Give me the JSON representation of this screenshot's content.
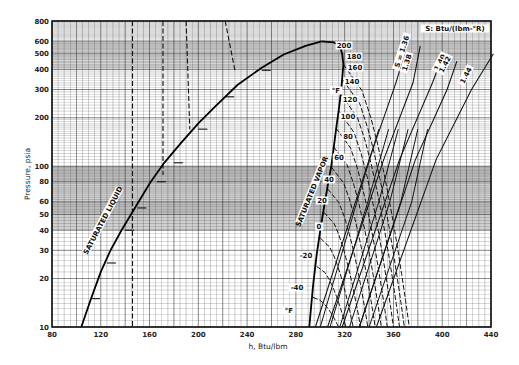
{
  "chart_data": {
    "type": "line",
    "title": "",
    "xlabel": "h, Btu/lbm",
    "ylabel": "Pressure, psia",
    "xlim": [
      80,
      440
    ],
    "ylim": [
      10,
      800
    ],
    "yscale": "log",
    "grid": true,
    "x_ticks": [
      80,
      120,
      160,
      200,
      240,
      280,
      320,
      360,
      400,
      440
    ],
    "y_ticks": [
      10,
      20,
      30,
      40,
      50,
      60,
      80,
      100,
      200,
      300,
      400,
      500,
      600,
      800
    ],
    "saturation_dome": {
      "liquid_label": "SATURATED LIQUID",
      "vapor_label": "SATURATED VAPOR",
      "liquid": [
        [
          104,
          10
        ],
        [
          112,
          15
        ],
        [
          120,
          22
        ],
        [
          128,
          30
        ],
        [
          137,
          40
        ],
        [
          148,
          55
        ],
        [
          160,
          78
        ],
        [
          172,
          105
        ],
        [
          186,
          140
        ],
        [
          200,
          185
        ],
        [
          215,
          240
        ],
        [
          232,
          320
        ],
        [
          252,
          410
        ],
        [
          270,
          495
        ],
        [
          288,
          560
        ],
        [
          301,
          597
        ]
      ],
      "vapor": [
        [
          301,
          597
        ],
        [
          311,
          590
        ],
        [
          316,
          560
        ],
        [
          318,
          500
        ],
        [
          319,
          430
        ],
        [
          318,
          350
        ],
        [
          317,
          290
        ],
        [
          315,
          220
        ],
        [
          313,
          170
        ],
        [
          311,
          130
        ],
        [
          309,
          100
        ],
        [
          306,
          75
        ],
        [
          303,
          55
        ],
        [
          300,
          40
        ],
        [
          297,
          28
        ],
        [
          294,
          18
        ],
        [
          291,
          10
        ]
      ]
    },
    "isotherms": {
      "unit_label": "°F",
      "series": [
        {
          "name": "-40",
          "label": "-40"
        },
        {
          "name": "-20",
          "label": "-20"
        },
        {
          "name": "0",
          "label": "0"
        },
        {
          "name": "20",
          "label": "20"
        },
        {
          "name": "40",
          "label": "40"
        },
        {
          "name": "60",
          "label": "60"
        },
        {
          "name": "80",
          "label": "80"
        },
        {
          "name": "100",
          "label": "100"
        },
        {
          "name": "120",
          "label": "120"
        },
        {
          "name": "140",
          "label": "140"
        },
        {
          "name": "160",
          "label": "160"
        },
        {
          "name": "180",
          "label": "180"
        },
        {
          "name": "200",
          "label": "200"
        }
      ],
      "liquid_region_dashed": [
        [
          [
            146,
            800
          ],
          [
            146,
            10
          ]
        ],
        [
          [
            171,
            800
          ],
          [
            171,
            88
          ]
        ],
        [
          [
            190,
            800
          ],
          [
            193,
            170
          ]
        ],
        [
          [
            222,
            800
          ],
          [
            230,
            395
          ]
        ]
      ]
    },
    "isentropes": {
      "unit_label": "S: Btu/(lbm-°R)",
      "series": [
        {
          "name": "1.36",
          "label": "S = 1.36"
        },
        {
          "name": "1.38",
          "label": "1.38"
        },
        {
          "name": "1.40",
          "label": "1.40"
        },
        {
          "name": "1.42",
          "label": "1.42"
        },
        {
          "name": "1.44",
          "label": "1.44"
        }
      ]
    }
  }
}
